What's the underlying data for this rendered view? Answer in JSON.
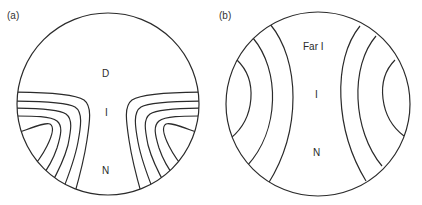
{
  "panels": [
    {
      "id": "a",
      "label": "(a)",
      "regions": {
        "top": "D",
        "middle": "I",
        "bottom": "N"
      }
    },
    {
      "id": "b",
      "label": "(b)",
      "regions": {
        "top": "Far I",
        "middle": "I",
        "bottom": "N"
      }
    }
  ],
  "colors": {
    "stroke": "#2b2b2b",
    "text": "#2a2a2a",
    "background": "#ffffff"
  }
}
